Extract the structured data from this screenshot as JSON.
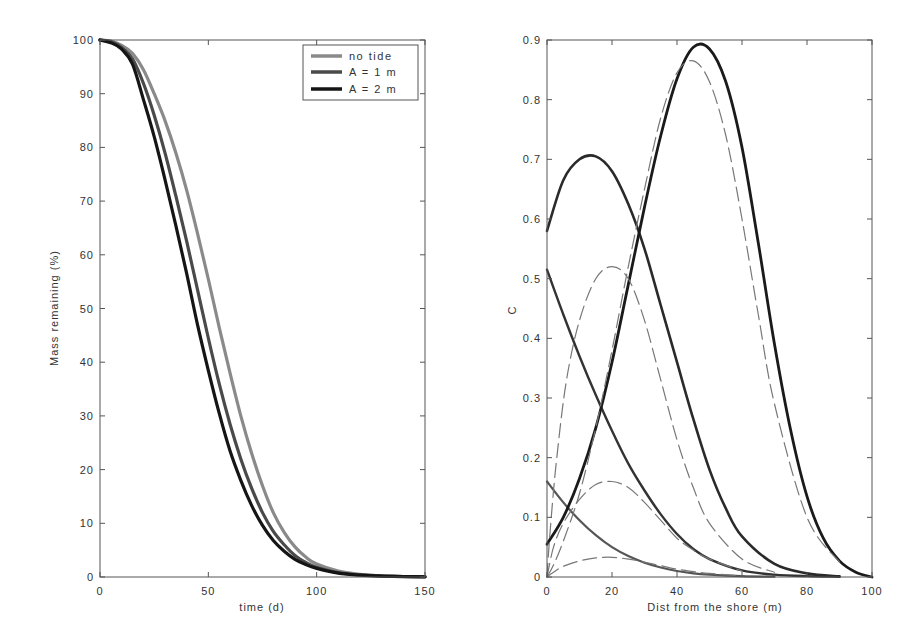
{
  "chart_data": [
    {
      "id": "mass",
      "type": "line",
      "title": "",
      "xlabel": "time (d)",
      "ylabel": "Mass remaining (%)",
      "xlim": [
        0,
        150
      ],
      "ylim": [
        0,
        100
      ],
      "xticks": [
        0,
        50,
        100,
        150
      ],
      "yticks": [
        0,
        10,
        20,
        30,
        40,
        50,
        60,
        70,
        80,
        90,
        100
      ],
      "grid": false,
      "legend_position": "upper right",
      "x": [
        0,
        5,
        10,
        15,
        20,
        25,
        30,
        35,
        40,
        45,
        50,
        55,
        60,
        65,
        70,
        75,
        80,
        85,
        90,
        95,
        100,
        110,
        120,
        130,
        140,
        150
      ],
      "series": [
        {
          "name": "no tide",
          "color": "#8a8a8a",
          "width": 3.2,
          "values": [
            100,
            99.8,
            99,
            97.5,
            94.5,
            90,
            85,
            79,
            72,
            64,
            55.5,
            46.5,
            38,
            30,
            23,
            17,
            12,
            8.3,
            5.6,
            3.7,
            2.4,
            1.1,
            0.5,
            0.2,
            0.1,
            0.05
          ]
        },
        {
          "name": "A = 1 m",
          "color": "#4a4a4a",
          "width": 3.2,
          "values": [
            100,
            99.7,
            98.6,
            96.5,
            92,
            86,
            79,
            71,
            62.5,
            53.5,
            44.5,
            36,
            28.5,
            22,
            16.5,
            12,
            8.5,
            6,
            4,
            2.7,
            1.8,
            0.8,
            0.4,
            0.2,
            0.1,
            0.05
          ]
        },
        {
          "name": "A = 2 m",
          "color": "#151515",
          "width": 3.2,
          "values": [
            100,
            99.5,
            98.3,
            95.5,
            89,
            82,
            74,
            65.5,
            56.5,
            47,
            38.5,
            30.5,
            23.5,
            18,
            13.3,
            9.6,
            6.8,
            4.8,
            3.3,
            2.3,
            1.6,
            0.7,
            0.35,
            0.15,
            0.07,
            0.03
          ]
        }
      ]
    },
    {
      "id": "concentration",
      "type": "line",
      "title": "",
      "xlabel": "Dist from the shore (m)",
      "ylabel": "C",
      "xlim": [
        0,
        100
      ],
      "ylim": [
        0,
        0.9
      ],
      "xticks": [
        0,
        20,
        40,
        60,
        80,
        100
      ],
      "yticks": [
        0,
        0.1,
        0.2,
        0.3,
        0.4,
        0.5,
        0.6,
        0.7,
        0.8,
        0.9
      ],
      "grid": false,
      "legend": "none",
      "series": [
        {
          "name": "solid-1",
          "style": "solid",
          "color": "#555555",
          "width": 2.2,
          "x": [
            0,
            5,
            10,
            15,
            20,
            25,
            30,
            35,
            40,
            45,
            50,
            60,
            70
          ],
          "values": [
            0.16,
            0.125,
            0.095,
            0.07,
            0.05,
            0.035,
            0.024,
            0.016,
            0.01,
            0.006,
            0.004,
            0.0015,
            0.0005
          ]
        },
        {
          "name": "solid-2",
          "style": "solid",
          "color": "#333333",
          "width": 2.4,
          "x": [
            0,
            5,
            10,
            15,
            20,
            25,
            30,
            35,
            40,
            45,
            50,
            60,
            70,
            80,
            90
          ],
          "values": [
            0.515,
            0.44,
            0.37,
            0.305,
            0.245,
            0.19,
            0.145,
            0.105,
            0.072,
            0.047,
            0.03,
            0.011,
            0.004,
            0.0015,
            0.0005
          ]
        },
        {
          "name": "solid-3",
          "style": "solid",
          "color": "#2a2a2a",
          "width": 2.6,
          "x": [
            0,
            5,
            10,
            15,
            20,
            25,
            30,
            35,
            40,
            45,
            50,
            55,
            60,
            70,
            80,
            90
          ],
          "values": [
            0.58,
            0.665,
            0.7,
            0.705,
            0.68,
            0.625,
            0.55,
            0.455,
            0.36,
            0.265,
            0.18,
            0.115,
            0.068,
            0.022,
            0.006,
            0.001
          ]
        },
        {
          "name": "solid-4",
          "style": "solid",
          "color": "#1a1a1a",
          "width": 2.8,
          "x": [
            0,
            5,
            10,
            15,
            20,
            25,
            30,
            35,
            40,
            45,
            50,
            55,
            60,
            65,
            70,
            75,
            80,
            85,
            90,
            95,
            100
          ],
          "values": [
            0.055,
            0.1,
            0.165,
            0.25,
            0.36,
            0.49,
            0.62,
            0.74,
            0.835,
            0.888,
            0.885,
            0.83,
            0.72,
            0.56,
            0.39,
            0.245,
            0.135,
            0.065,
            0.027,
            0.008,
            0.0
          ]
        },
        {
          "name": "dashed-1",
          "style": "dashed",
          "color": "#777777",
          "width": 1.2,
          "x": [
            0,
            2,
            5,
            10,
            15,
            20,
            25,
            30,
            35,
            40,
            45,
            50,
            60
          ],
          "values": [
            0,
            0.008,
            0.018,
            0.027,
            0.032,
            0.033,
            0.03,
            0.025,
            0.019,
            0.013,
            0.009,
            0.006,
            0.002
          ]
        },
        {
          "name": "dashed-2",
          "style": "dashed",
          "color": "#777777",
          "width": 1.2,
          "x": [
            0,
            2,
            5,
            10,
            15,
            20,
            25,
            30,
            35,
            40,
            45,
            50,
            60
          ],
          "values": [
            0,
            0.05,
            0.09,
            0.13,
            0.155,
            0.16,
            0.15,
            0.125,
            0.095,
            0.065,
            0.045,
            0.03,
            0.01
          ]
        },
        {
          "name": "dashed-3",
          "style": "dashed",
          "color": "#777777",
          "width": 1.2,
          "x": [
            0,
            1,
            3,
            6,
            10,
            15,
            20,
            25,
            30,
            35,
            40,
            45,
            50,
            60,
            70
          ],
          "values": [
            0,
            0.08,
            0.2,
            0.33,
            0.43,
            0.5,
            0.52,
            0.5,
            0.43,
            0.33,
            0.23,
            0.15,
            0.09,
            0.03,
            0.008
          ]
        },
        {
          "name": "dashed-4",
          "style": "dashed",
          "color": "#777777",
          "width": 1.2,
          "x": [
            0,
            2,
            5,
            10,
            15,
            20,
            25,
            30,
            35,
            40,
            45,
            50,
            55,
            60,
            65,
            70,
            80,
            90
          ],
          "values": [
            0,
            0.02,
            0.06,
            0.14,
            0.25,
            0.38,
            0.52,
            0.65,
            0.77,
            0.845,
            0.865,
            0.83,
            0.74,
            0.6,
            0.44,
            0.29,
            0.1,
            0.025
          ]
        }
      ]
    }
  ]
}
